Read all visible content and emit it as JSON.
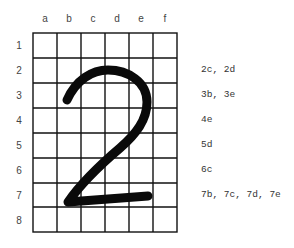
{
  "grid": {
    "columns": [
      "a",
      "b",
      "c",
      "d",
      "e",
      "f"
    ],
    "rows": [
      "1",
      "2",
      "3",
      "4",
      "5",
      "6",
      "7",
      "8"
    ],
    "line_color": "#111111"
  },
  "glyph": {
    "character": "2",
    "stroke_color": "#0a0a0a"
  },
  "notes": [
    {
      "row": "2",
      "text": "2c, 2d"
    },
    {
      "row": "3",
      "text": "3b, 3e"
    },
    {
      "row": "4",
      "text": "4e"
    },
    {
      "row": "5",
      "text": "5d"
    },
    {
      "row": "6",
      "text": "6c"
    },
    {
      "row": "7",
      "text": "7b, 7c, 7d, 7e"
    }
  ]
}
